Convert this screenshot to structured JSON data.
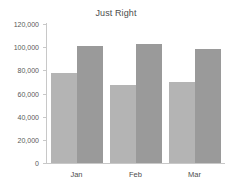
{
  "chart_data": {
    "type": "bar",
    "title": "Just Right",
    "xlabel": "",
    "ylabel": "",
    "categories": [
      "Jan",
      "Feb",
      "Mar"
    ],
    "series": [
      {
        "name": "Series 1",
        "values": [
          78000,
          67000,
          70000
        ],
        "color": "#b4b4b4"
      },
      {
        "name": "Series 2",
        "values": [
          101000,
          103000,
          98000
        ],
        "color": "#9a9a9a"
      }
    ],
    "ylim": [
      0,
      120000
    ],
    "ytick_values": [
      0,
      20000,
      40000,
      60000,
      80000,
      100000,
      120000
    ],
    "ytick_labels": [
      "0",
      "20,000",
      "40,000",
      "60,000",
      "80,000",
      "100,000",
      "120,000"
    ],
    "grid": false,
    "legend": "none",
    "axis_color": "#c8c8c8",
    "text_color": "#4d4d4d"
  }
}
